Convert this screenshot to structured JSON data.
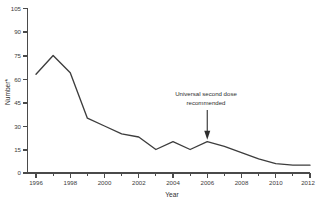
{
  "chart_data": {
    "type": "line",
    "title": "",
    "xlabel": "Year",
    "ylabel": "Number*",
    "ylabel_base": "Number",
    "ylabel_superscript": "*",
    "xlim": [
      1996,
      2012
    ],
    "ylim": [
      0,
      105
    ],
    "grid": false,
    "legend": "none",
    "y_ticks": [
      0,
      15,
      30,
      45,
      60,
      75,
      90,
      105
    ],
    "y_tick_labels": [
      "0",
      "15",
      "30",
      "45",
      "60",
      "75",
      "90",
      "105"
    ],
    "x_ticks_major": [
      1996,
      1998,
      2000,
      2002,
      2004,
      2006,
      2008,
      2010,
      2012
    ],
    "x_tick_labels": [
      "1996",
      "1998",
      "2000",
      "2002",
      "2004",
      "2006",
      "2008",
      "2010",
      "2012"
    ],
    "x_ticks_minor": [
      1997,
      1999,
      2001,
      2003,
      2005,
      2007,
      2009,
      2011
    ],
    "x": [
      1996,
      1997,
      1998,
      1999,
      2000,
      2001,
      2002,
      2003,
      2004,
      2005,
      2006,
      2007,
      2008,
      2009,
      2010,
      2011,
      2012
    ],
    "values": [
      63,
      75,
      64,
      35,
      30,
      25,
      23,
      15,
      20,
      15,
      20,
      17,
      13,
      9,
      6,
      5,
      5
    ],
    "series": [
      {
        "name": "Number",
        "color": "#3d3d3d",
        "values": [
          63,
          75,
          64,
          35,
          30,
          25,
          23,
          15,
          20,
          15,
          20,
          17,
          13,
          9,
          6,
          5,
          5
        ]
      }
    ],
    "annotations": [
      {
        "id": "universal-second-dose",
        "line1": "Universal second dose",
        "line2": "recommended",
        "x": 2006,
        "y": 20
      }
    ]
  }
}
